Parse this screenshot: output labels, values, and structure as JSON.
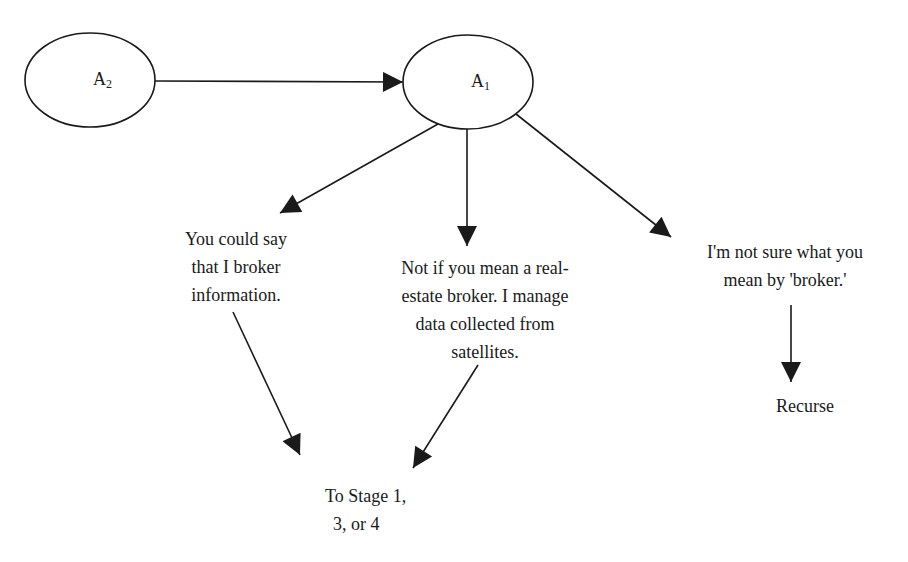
{
  "diagram": {
    "nodes": {
      "a2": {
        "letter": "A",
        "subscript": "2"
      },
      "a1": {
        "letter": "A",
        "subscript": "1"
      }
    },
    "responses": {
      "left": {
        "lines": [
          "You could say",
          "that I broker",
          "information."
        ]
      },
      "middle": {
        "lines": [
          "Not if you mean a real-",
          "estate broker.  I manage",
          "data collected from",
          "satellites."
        ]
      },
      "right": {
        "lines": [
          "I'm not sure what you",
          "mean by 'broker.'"
        ]
      }
    },
    "outcomes": {
      "stage": {
        "lines": [
          "To Stage 1,",
          "3, or 4"
        ]
      },
      "recurse": {
        "label": "Recurse"
      }
    },
    "edges": [
      {
        "from": "A2",
        "to": "A1"
      },
      {
        "from": "A1",
        "to": "left-response"
      },
      {
        "from": "A1",
        "to": "middle-response"
      },
      {
        "from": "A1",
        "to": "right-response"
      },
      {
        "from": "left-response",
        "to": "stage-outcome"
      },
      {
        "from": "middle-response",
        "to": "stage-outcome"
      },
      {
        "from": "right-response",
        "to": "recurse-outcome"
      }
    ],
    "colors": {
      "stroke": "#1a1a1a",
      "background": "#ffffff"
    }
  }
}
